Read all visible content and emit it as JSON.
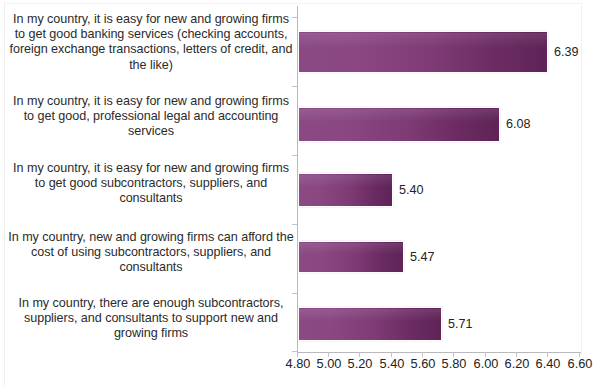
{
  "chart_data": {
    "type": "bar",
    "orientation": "horizontal",
    "title": "",
    "subtitle": "",
    "xlabel": "",
    "ylabel": "",
    "grid": false,
    "legend": false,
    "legend_position": "none",
    "xlim": [
      4.8,
      6.6
    ],
    "xticks": [
      4.8,
      5.0,
      5.2,
      5.4,
      5.6,
      5.8,
      6.0,
      6.2,
      6.4,
      6.6
    ],
    "xtick_labels": [
      "4.80",
      "5.00",
      "5.20",
      "5.40",
      "5.60",
      "5.80",
      "6.00",
      "6.20",
      "6.40",
      "6.60"
    ],
    "categories": [
      "In my country, it is easy for new and growing firms to get good banking services (checking accounts, foreign exchange transactions, letters of credit, and the like)",
      "In my country, it is easy for new and growing firms to get good, professional legal and accounting services",
      "In my country, it is easy for new and growing firms to get good subcontractors, suppliers, and consultants",
      "In my country, new and growing firms can afford the cost of using subcontractors, suppliers, and consultants",
      "In my country, there are enough subcontractors, suppliers, and consultants to support new and growing firms"
    ],
    "values": [
      6.39,
      6.08,
      5.4,
      5.47,
      5.71
    ],
    "value_labels": [
      "6.39",
      "6.08",
      "5.40",
      "5.47",
      "5.71"
    ],
    "series": [
      {
        "name": "",
        "values": [
          6.39,
          6.08,
          5.4,
          5.47,
          5.71
        ]
      }
    ],
    "bar_color_start": "#8b4a84",
    "bar_color_end": "#5e2356",
    "axis_color": "#b9b9bd",
    "text_color": "#232323",
    "background": "#ffffff"
  }
}
